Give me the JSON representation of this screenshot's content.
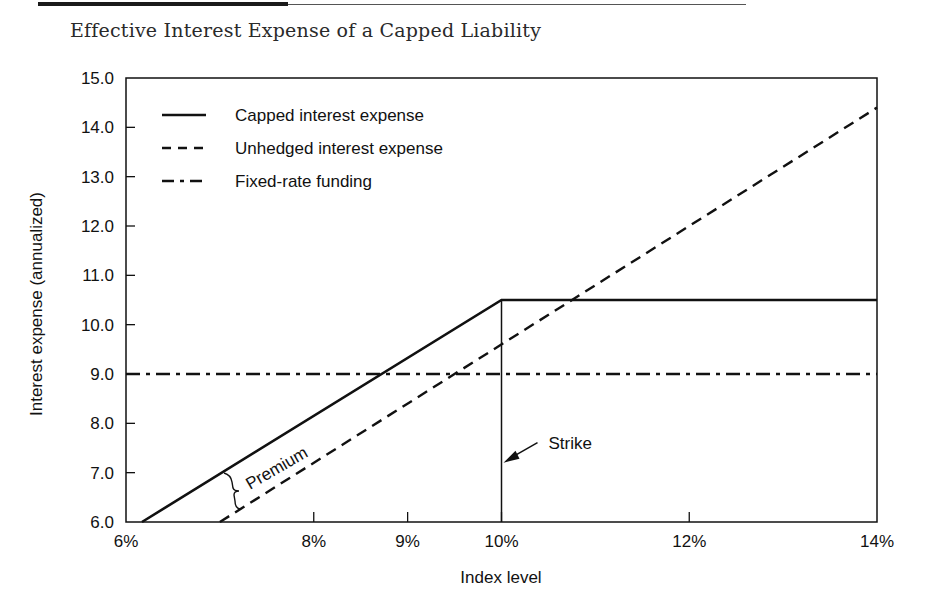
{
  "figure": {
    "title": "Effective Interest Expense of a Capped Liability"
  },
  "chart_data": {
    "type": "line",
    "title": "Effective Interest Expense of a Capped Liability",
    "xlabel": "Index level",
    "ylabel": "Interest expense (annualized)",
    "xlim": [
      6,
      14
    ],
    "ylim": [
      6.0,
      15.0
    ],
    "x_ticks": [
      {
        "value": 6,
        "label": "6%"
      },
      {
        "value": 8,
        "label": "8%"
      },
      {
        "value": 9,
        "label": "9%"
      },
      {
        "value": 10,
        "label": "10%"
      },
      {
        "value": 12,
        "label": "12%"
      },
      {
        "value": 14,
        "label": "14%"
      }
    ],
    "y_ticks": [
      {
        "value": 6.0,
        "label": "6.0"
      },
      {
        "value": 7.0,
        "label": "7.0"
      },
      {
        "value": 8.0,
        "label": "8.0"
      },
      {
        "value": 9.0,
        "label": "9.0"
      },
      {
        "value": 10.0,
        "label": "10.0"
      },
      {
        "value": 11.0,
        "label": "11.0"
      },
      {
        "value": 12.0,
        "label": "12.0"
      },
      {
        "value": 13.0,
        "label": "13.0"
      },
      {
        "value": 14.0,
        "label": "14.0"
      },
      {
        "value": 15.0,
        "label": "15.0"
      }
    ],
    "grid": false,
    "legend_position": "upper-left",
    "series": [
      {
        "name": "Capped interest expense",
        "style": "solid",
        "x": [
          6.17,
          10,
          14
        ],
        "y": [
          6.0,
          10.5,
          10.5
        ]
      },
      {
        "name": "Unhedged interest expense",
        "style": "dashed",
        "x": [
          7.0,
          14
        ],
        "y": [
          6.0,
          14.4
        ]
      },
      {
        "name": "Fixed-rate funding",
        "style": "dash-dot",
        "x": [
          6,
          14
        ],
        "y": [
          9.0,
          9.0
        ]
      }
    ],
    "annotations": [
      {
        "text": "Strike",
        "x": 10,
        "y": 7.0,
        "type": "arrow-label",
        "note": "vertical line at 10% from 6.0 to 10.5"
      },
      {
        "text": "Premium",
        "x": 7.0,
        "y": 6.7,
        "type": "brace-label",
        "note": "gap between capped and unhedged lines (~0.9)"
      }
    ]
  },
  "colors": {
    "ink": "#111111",
    "background": "#ffffff"
  }
}
